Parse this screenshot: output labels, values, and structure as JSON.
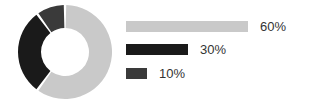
{
  "chart_data": [
    {
      "type": "pie",
      "title": "",
      "variant": "donut",
      "categories": [
        "Segment 1",
        "Segment 2",
        "Segment 3"
      ],
      "values": [
        60,
        30,
        10
      ],
      "unit": "%",
      "colors": [
        "#c9c9c9",
        "#1a1a1a",
        "#3a3a3a"
      ],
      "start_angle_deg": 0,
      "direction": "clockwise",
      "inner_radius_ratio": 0.5,
      "gap_deg": 3,
      "legend": "none",
      "labels_shown": false
    },
    {
      "type": "bar",
      "orientation": "horizontal",
      "title": "",
      "xlabel": "",
      "ylabel": "",
      "categories": [
        "60%",
        "30%",
        "10%"
      ],
      "values": [
        60,
        30,
        10
      ],
      "unit": "%",
      "colors": [
        "#c9c9c9",
        "#1a1a1a",
        "#3a3a3a"
      ],
      "data_labels": [
        "60%",
        "30%",
        "10%"
      ],
      "xlim": [
        0,
        60
      ],
      "grid": false,
      "axis_visible": false,
      "max_bar_px": 122
    }
  ],
  "canvas": {
    "width": 310,
    "height": 102,
    "background": "#ffffff"
  },
  "donut": {
    "center_x": 49,
    "center_y": 48,
    "outer_radius": 47,
    "inner_radius": 24,
    "gap_color": "#ffffff"
  },
  "legend_rows": [
    {
      "label": "60%",
      "value": 60,
      "color": "#c9c9c9",
      "bar_px": 122
    },
    {
      "label": "30%",
      "value": 30,
      "color": "#1a1a1a",
      "bar_px": 62
    },
    {
      "label": "10%",
      "value": 10,
      "color": "#3a3a3a",
      "bar_px": 21
    }
  ]
}
